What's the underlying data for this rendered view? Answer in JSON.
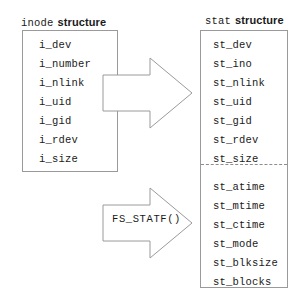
{
  "diagram": {
    "background_color": "#ffffff",
    "line_color": "#9a9a9a",
    "text_color": "#1a1a1a"
  },
  "inode": {
    "struct_name": "inode",
    "struct_kind": "structure",
    "fields": [
      "i_dev",
      "i_number",
      "i_nlink",
      "i_uid",
      "i_gid",
      "i_rdev",
      "i_size"
    ]
  },
  "stat": {
    "struct_name": "stat",
    "struct_kind": "structure",
    "group_1": [
      "st_dev",
      "st_ino",
      "st_nlink",
      "st_uid",
      "st_gid",
      "st_rdev",
      "st_size"
    ],
    "group_2": [
      "st_atime",
      "st_mtime",
      "st_ctime",
      "st_mode",
      "st_blksize",
      "st_blocks"
    ]
  },
  "arrows": {
    "top": {
      "label": "",
      "points": "0,17 47,17 47,0 89,35 47,70 47,53 0,53"
    },
    "bottom": {
      "label": "FS_STATF()",
      "points": "0,17 47,17 47,0 89,35 47,70 47,53 0,53"
    }
  }
}
